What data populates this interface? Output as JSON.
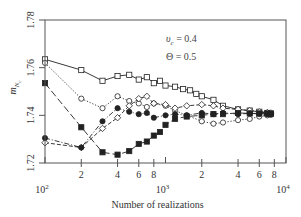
{
  "chart_data": {
    "type": "line",
    "title": "",
    "xlabel": "Number of realizations",
    "ylabel": "m_{N_c}",
    "xscale": "log",
    "xlim": [
      100,
      10000
    ],
    "ylim": [
      1.72,
      1.78
    ],
    "grid": false,
    "legend": "none",
    "x_ticks_major": [
      {
        "value": 100,
        "label": "10",
        "sup": "2"
      },
      {
        "value": 1000,
        "label": "10",
        "sup": "3"
      },
      {
        "value": 10000,
        "label": "10",
        "sup": "4"
      }
    ],
    "x_ticks_minor": [
      {
        "value": 200,
        "label": "2"
      },
      {
        "value": 400,
        "label": "4"
      },
      {
        "value": 600,
        "label": "6"
      },
      {
        "value": 800,
        "label": "8"
      },
      {
        "value": 2000,
        "label": "2"
      },
      {
        "value": 4000,
        "label": "4"
      },
      {
        "value": 6000,
        "label": "6"
      },
      {
        "value": 8000,
        "label": "8"
      }
    ],
    "y_ticks": [
      {
        "value": 1.72,
        "label": "1.72"
      },
      {
        "value": 1.74,
        "label": "1.74"
      },
      {
        "value": 1.76,
        "label": "1.76"
      },
      {
        "value": 1.78,
        "label": "1.78"
      }
    ],
    "annotations": [
      {
        "text": "υc = 0.4",
        "main": "υ",
        "sub": "c",
        "rest": " = 0.4"
      },
      {
        "text": "Θ = 0.5"
      }
    ],
    "series": [
      {
        "name": "open squares",
        "marker": "square-open",
        "line": "solid",
        "x": [
          100,
          200,
          300,
          400,
          500,
          600,
          700,
          800,
          900,
          1000,
          1200,
          1400,
          1600,
          1800,
          2000,
          2500,
          3000,
          4000,
          5000,
          6000,
          7000,
          7500
        ],
        "y": [
          1.7635,
          1.759,
          1.7545,
          1.7565,
          1.757,
          1.755,
          1.756,
          1.7535,
          1.7545,
          1.7525,
          1.752,
          1.751,
          1.7505,
          1.749,
          1.748,
          1.7465,
          1.744,
          1.7425,
          1.742,
          1.7415,
          1.741,
          1.7408
        ]
      },
      {
        "name": "open circles",
        "marker": "circle-open",
        "line": "dotted",
        "x": [
          100,
          200,
          300,
          400,
          500,
          600,
          700,
          800,
          1000,
          1200,
          1500,
          2000,
          2500,
          3000,
          4000,
          5000,
          6000,
          7000,
          7500
        ],
        "y": [
          1.762,
          1.747,
          1.743,
          1.748,
          1.746,
          1.745,
          1.7435,
          1.745,
          1.744,
          1.742,
          1.74,
          1.7375,
          1.7365,
          1.737,
          1.738,
          1.7385,
          1.7395,
          1.74,
          1.7402
        ]
      },
      {
        "name": "open diamonds",
        "marker": "diamond-open",
        "line": "dashed",
        "x": [
          100,
          200,
          300,
          400,
          500,
          600,
          700,
          800,
          1000,
          1200,
          1500,
          2000,
          2500,
          3000,
          4000,
          5000,
          6000,
          7000,
          7500
        ],
        "y": [
          1.7285,
          1.7265,
          1.7345,
          1.739,
          1.744,
          1.747,
          1.748,
          1.745,
          1.7445,
          1.743,
          1.744,
          1.7445,
          1.744,
          1.743,
          1.7425,
          1.742,
          1.7415,
          1.7412,
          1.741
        ]
      },
      {
        "name": "filled circles",
        "marker": "circle-filled",
        "line": "dash-dot",
        "x": [
          100,
          200,
          300,
          400,
          500,
          600,
          700,
          800,
          1000,
          1200,
          1500,
          2000,
          2500,
          3000,
          4000,
          5000,
          6000,
          7000,
          7500
        ],
        "y": [
          1.7305,
          1.7265,
          1.7375,
          1.743,
          1.7415,
          1.7405,
          1.741,
          1.739,
          1.74,
          1.7405,
          1.74,
          1.741,
          1.7405,
          1.741,
          1.7405,
          1.7408,
          1.7406,
          1.7405,
          1.7405
        ]
      },
      {
        "name": "filled squares",
        "marker": "square-filled",
        "line": "long-dash",
        "x": [
          100,
          200,
          300,
          400,
          500,
          600,
          700,
          800,
          900,
          1000,
          1200,
          1500,
          2000,
          2500,
          3000,
          4000,
          5000,
          6000,
          7000,
          7500
        ],
        "y": [
          1.7535,
          1.735,
          1.7245,
          1.7235,
          1.725,
          1.728,
          1.729,
          1.7315,
          1.733,
          1.736,
          1.7385,
          1.7395,
          1.74,
          1.7405,
          1.7405,
          1.741,
          1.7408,
          1.7408,
          1.7408,
          1.7407
        ]
      }
    ]
  },
  "layout": {
    "plot_left": 45,
    "plot_top": 20,
    "plot_right": 286,
    "plot_bottom": 163
  },
  "colors": {
    "axis": "#555555",
    "series": "#222222"
  }
}
